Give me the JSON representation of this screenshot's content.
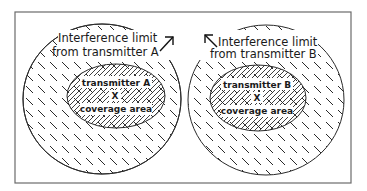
{
  "diagram": {
    "frame": {
      "x": 15,
      "y": 12,
      "width": 336,
      "height": 171
    },
    "colors": {
      "line": "#2a2a2a",
      "frame": "#6b6b6b",
      "background": "#ffffff"
    },
    "transmitter_a": {
      "interference_ellipse": {
        "cx": 102,
        "cy": 99,
        "rx": 79,
        "ry": 75
      },
      "coverage_ellipse": {
        "cx": 116,
        "cy": 96,
        "rx": 49,
        "ry": 32
      },
      "interference_label_line1": "Interference limit",
      "interference_label_line2": "from transmitter A",
      "name_label": "transmitter A",
      "marker": "X",
      "coverage_label": "coverage area"
    },
    "transmitter_b": {
      "interference_ellipse": {
        "cx": 266,
        "cy": 100,
        "rx": 78,
        "ry": 75
      },
      "coverage_ellipse": {
        "cx": 258,
        "cy": 98,
        "rx": 48,
        "ry": 33
      },
      "interference_label_line1": "Interference limit",
      "interference_label_line2": "from transmitter B",
      "name_label": "transmitter B",
      "marker": "X",
      "coverage_label": "coverage area"
    }
  }
}
